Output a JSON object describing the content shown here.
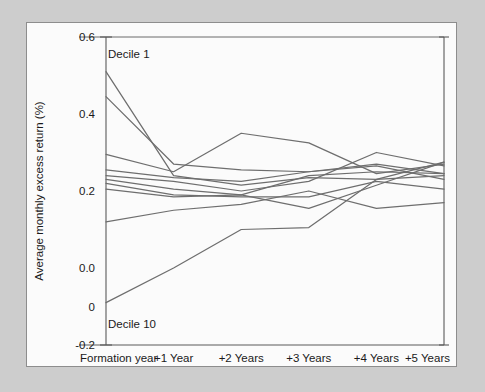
{
  "figure": {
    "panel_name": "exhibit-panel",
    "background_color": "#cdcdcd",
    "panel_color": "#fbfbfb",
    "line_color": "#6e6e6e",
    "axis_color": "#5a5a5a"
  },
  "chart_data": {
    "type": "line",
    "title": "",
    "xlabel": "",
    "ylabel": "Average monthly excess return (%)",
    "categories": [
      "Formation year",
      "+1 Year",
      "+2 Years",
      "+3 Years",
      "+4 Years",
      "+5 Years"
    ],
    "x": [
      0,
      1,
      2,
      3,
      4,
      5
    ],
    "ylim": [
      -0.2,
      0.6
    ],
    "yticks": [
      0.6,
      0.4,
      0.2,
      0.0,
      -0.1,
      -0.2
    ],
    "ytick_labels": [
      "0.6",
      "0.4",
      "0.2",
      "0.0",
      "0",
      "-0.2"
    ],
    "grid": false,
    "legend": "none",
    "annotations": [
      {
        "text": "Decile 1",
        "x": 0,
        "y": 0.555
      },
      {
        "text": "Decile 10",
        "x": 0,
        "y": -0.145
      }
    ],
    "series": [
      {
        "name": "Decile 1",
        "values": [
          0.51,
          0.24,
          0.215,
          0.235,
          0.23,
          0.275
        ]
      },
      {
        "name": "Decile 2",
        "values": [
          0.445,
          0.27,
          0.255,
          0.25,
          0.27,
          0.245
        ]
      },
      {
        "name": "Decile 3",
        "values": [
          0.295,
          0.25,
          0.35,
          0.325,
          0.245,
          0.27
        ]
      },
      {
        "name": "Decile 4",
        "values": [
          0.255,
          0.235,
          0.225,
          0.25,
          0.265,
          0.23
        ]
      },
      {
        "name": "Decile 5",
        "values": [
          0.24,
          0.225,
          0.2,
          0.225,
          0.3,
          0.265
        ]
      },
      {
        "name": "Decile 6",
        "values": [
          0.23,
          0.205,
          0.19,
          0.24,
          0.25,
          0.245
        ]
      },
      {
        "name": "Decile 7",
        "values": [
          0.22,
          0.19,
          0.185,
          0.185,
          0.225,
          0.205
        ]
      },
      {
        "name": "Decile 8",
        "values": [
          0.205,
          0.185,
          0.19,
          0.155,
          0.215,
          0.275
        ]
      },
      {
        "name": "Decile 9",
        "values": [
          0.12,
          0.15,
          0.165,
          0.2,
          0.155,
          0.17
        ]
      },
      {
        "name": "Decile 10",
        "values": [
          -0.09,
          0.0,
          0.1,
          0.105,
          0.23,
          0.24
        ]
      }
    ]
  }
}
